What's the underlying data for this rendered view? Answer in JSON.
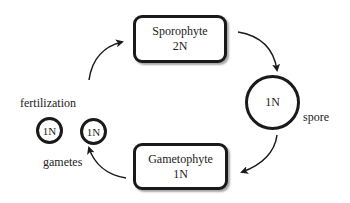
{
  "diagram": {
    "sporophyte": {
      "name": "Sporophyte",
      "ploidy": "2N"
    },
    "gametophyte": {
      "name": "Gametophyte",
      "ploidy": "1N"
    },
    "spore": {
      "ploidy": "1N",
      "label": "spore"
    },
    "gametes": [
      {
        "ploidy": "1N"
      },
      {
        "ploidy": "1N"
      }
    ],
    "gametes_label": "gametes",
    "fertilization_label": "fertilization",
    "colors": {
      "stroke": "#1a1a1a",
      "background": "#ffffff"
    }
  }
}
